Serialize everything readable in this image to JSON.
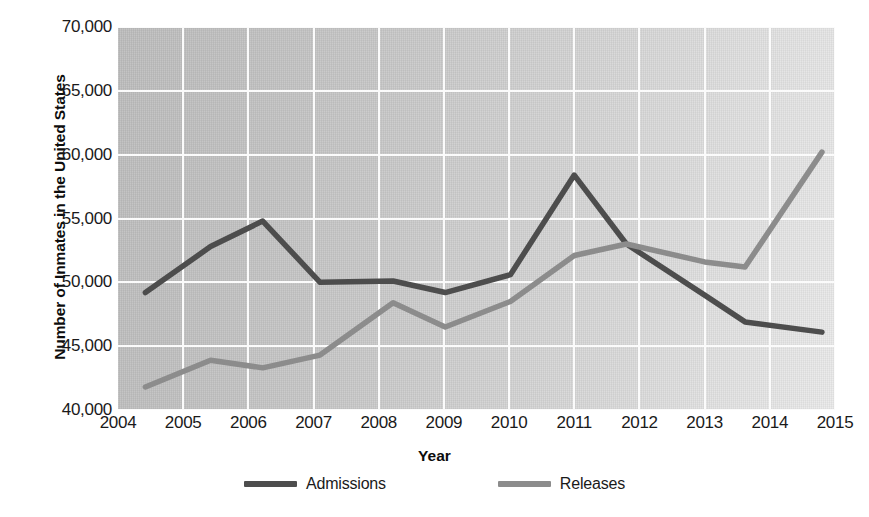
{
  "chart_data": {
    "type": "line",
    "title": "",
    "xlabel": "Year",
    "ylabel": "Number of Inmates in the United States",
    "xlim": [
      2004,
      2015
    ],
    "ylim": [
      40000,
      70000
    ],
    "grid": true,
    "legend_position": "bottom",
    "x_tick_labels": [
      "2004",
      "2005",
      "2006",
      "2007",
      "2008",
      "2009",
      "2010",
      "2011",
      "2012",
      "2013",
      "2014",
      "2015"
    ],
    "y_tick_labels": [
      "40,000",
      "45,000",
      "50,000",
      "55,000",
      "60,000",
      "65,000",
      "70,000"
    ],
    "y_ticks": [
      40000,
      45000,
      50000,
      55000,
      60000,
      65000,
      70000
    ],
    "series": [
      {
        "name": "Admissions",
        "color": "#4d4d4d",
        "x": [
          2004.42,
          2005.42,
          2006.22,
          2007.1,
          2008.22,
          2009.02,
          2010.02,
          2011.0,
          2011.8,
          2013.0,
          2013.62,
          2014.8
        ],
        "values": [
          49200,
          52800,
          54800,
          50000,
          50100,
          49200,
          50600,
          58400,
          53000,
          49000,
          46900,
          46100
        ]
      },
      {
        "name": "Releases",
        "color": "#8c8c8c",
        "x": [
          2004.42,
          2005.42,
          2006.22,
          2007.1,
          2008.22,
          2009.02,
          2010.02,
          2011.0,
          2011.8,
          2013.0,
          2013.62,
          2014.8
        ],
        "values": [
          41800,
          43900,
          43300,
          44300,
          48400,
          46500,
          48500,
          52100,
          53000,
          51600,
          51200,
          60200
        ]
      }
    ]
  },
  "legend": {
    "items": [
      {
        "label": "Admissions",
        "color": "#4d4d4d"
      },
      {
        "label": "Releases",
        "color": "#8c8c8c"
      }
    ]
  },
  "axes": {
    "x_title": "Year",
    "y_title": "Number of Inmates in the United States"
  }
}
